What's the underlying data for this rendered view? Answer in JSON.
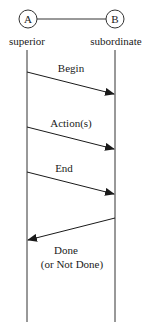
{
  "diagram": {
    "type": "sequence",
    "colors": {
      "line": "#333333",
      "text": "#1a1a1a",
      "background": "#ffffff"
    },
    "participants": [
      {
        "id": "A",
        "label": "A",
        "role": "superior"
      },
      {
        "id": "B",
        "label": "B",
        "role": "subordinate"
      }
    ],
    "messages": [
      {
        "from": "A",
        "to": "B",
        "label": "Begin"
      },
      {
        "from": "A",
        "to": "B",
        "label": "Action(s)"
      },
      {
        "from": "A",
        "to": "B",
        "label": "End"
      },
      {
        "from": "B",
        "to": "A",
        "label_line1": "Done",
        "label_line2": "(or Not Done)"
      }
    ]
  }
}
